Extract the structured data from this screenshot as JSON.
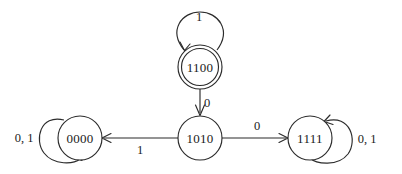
{
  "diagram": {
    "kind": "finite-state-machine",
    "title": "",
    "background_color": "#ffffff",
    "stroke_color": "#2b2b2b",
    "text_color": "#1a1a1a",
    "states": [
      {
        "id": "s0000",
        "label": "0000",
        "cx": 80,
        "cy": 138,
        "r": 22,
        "accepting": false
      },
      {
        "id": "s1010",
        "label": "1010",
        "cx": 200,
        "cy": 138,
        "r": 22,
        "accepting": false
      },
      {
        "id": "s1111",
        "label": "1111",
        "cx": 310,
        "cy": 138,
        "r": 22,
        "accepting": false
      },
      {
        "id": "s1100",
        "label": "1100",
        "cx": 200,
        "cy": 67,
        "r": 22,
        "accepting": true
      }
    ],
    "transitions": [
      {
        "id": "t-1100-1010",
        "from": "1100",
        "to": "1010",
        "label": "0",
        "label_x": 207,
        "label_y": 103,
        "direction": "down"
      },
      {
        "id": "t-1010-0000",
        "from": "1010",
        "to": "0000",
        "label": "1",
        "label_x": 140,
        "label_y": 150,
        "direction": "left"
      },
      {
        "id": "t-1010-1111",
        "from": "1010",
        "to": "1111",
        "label": "0",
        "label_x": 257,
        "label_y": 126,
        "direction": "right"
      }
    ],
    "self_loops": [
      {
        "id": "loop-0000",
        "state": "0000",
        "label": "0, 1",
        "label_x": 24,
        "label_y": 138,
        "side": "left"
      },
      {
        "id": "loop-1111",
        "state": "1111",
        "label": "0, 1",
        "label_x": 367,
        "label_y": 139,
        "side": "right"
      },
      {
        "id": "loop-1100",
        "state": "1100",
        "label": "1",
        "label_x": 199,
        "label_y": 17,
        "side": "top"
      }
    ]
  }
}
